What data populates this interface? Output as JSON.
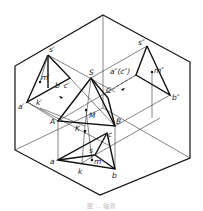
{
  "figure": {
    "type": "axonometric projection of triangular pyramid with point on surface",
    "caption": "图 … 轴测",
    "labels": {
      "s_front": "s′",
      "m_front": "m′",
      "b_front_c_front": "b′ c′",
      "a_front": "a′",
      "k_front": "k′",
      "S": "S",
      "A": "A",
      "B": "B",
      "C": "C",
      "M": "M",
      "K": "K",
      "s_side": "s″",
      "a_side_c_side": "a″(c″)",
      "m_side": "m″",
      "b_side": "b″",
      "c_top": "c",
      "a_top": "a",
      "b_top": "b",
      "k_top": "k",
      "s_top": "s",
      "m_top": "m"
    }
  }
}
